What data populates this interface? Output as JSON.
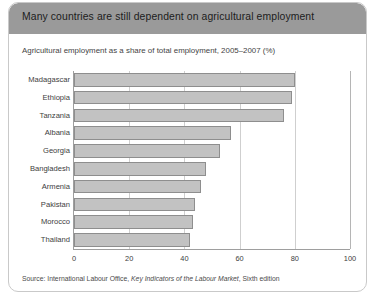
{
  "figure": {
    "title": "Many countries are still dependent on agricultural employment",
    "subtitle": "Agricultural employment as a share of total employment, 2005–2007 (%)",
    "source_prefix": "Source: International Labour Office, ",
    "source_italic": "Key Indicators of the Labour Market",
    "source_suffix": ", Sixth edition",
    "colors": {
      "title_bar": "#9a9a9a",
      "title_text": "#1c1c1c",
      "bar_fill": "#c2c2c2",
      "bar_stroke": "#8e8e8e",
      "axis": "#9e9e9e",
      "gridline": "#cfcfcf",
      "card_border": "#c9c9c9"
    }
  },
  "chart_data": {
    "type": "bar",
    "orientation": "horizontal",
    "title": "Many countries are still dependent on agricultural employment",
    "subtitle": "Agricultural employment as a share of total employment, 2005–2007 (%)",
    "xlabel": "",
    "ylabel": "",
    "xlim": [
      0,
      100
    ],
    "xticks": [
      0,
      20,
      40,
      60,
      80,
      100
    ],
    "xtick_labels": [
      "0",
      "20",
      "40",
      "60",
      "80",
      "100"
    ],
    "grid": true,
    "grid_axis": "x",
    "legend": false,
    "categories": [
      "Madagascar",
      "Ethiopia",
      "Tanzania",
      "Albania",
      "Georgia",
      "Bangladesh",
      "Armenia",
      "Pakistan",
      "Morocco",
      "Thailand"
    ],
    "values": [
      80,
      79,
      76,
      57,
      53,
      48,
      46,
      44,
      43,
      42
    ],
    "units": "%"
  }
}
